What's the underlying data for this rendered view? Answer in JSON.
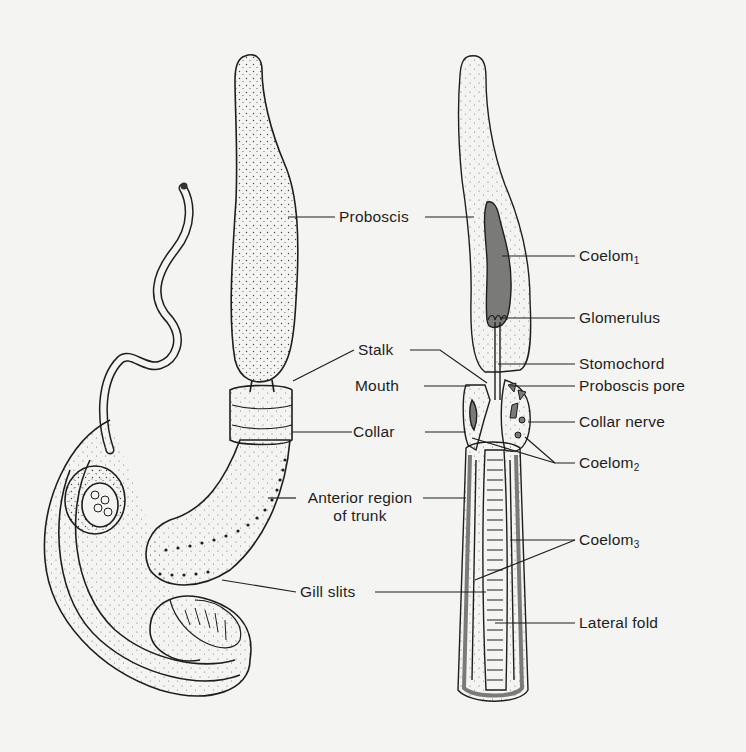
{
  "figure": {
    "background": "#f4f4f2",
    "ink": "#1e1e1e",
    "coelom_shade": "#7a7a78",
    "external_view": {
      "labels": {
        "proboscis": "Proboscis",
        "stalk": "Stalk",
        "mouth": "Mouth",
        "collar": "Collar",
        "anterior_trunk_line1": "Anterior region",
        "anterior_trunk_line2": "of trunk",
        "gill_slits": "Gill slits"
      }
    },
    "section_view": {
      "labels": {
        "coelom1": "Coelom",
        "coelom1_sub": "1",
        "glomerulus": "Glomerulus",
        "stomochord": "Stomochord",
        "proboscis_pore": "Proboscis pore",
        "collar_nerve": "Collar nerve",
        "coelom2": "Coelom",
        "coelom2_sub": "2",
        "coelom3": "Coelom",
        "coelom3_sub": "3",
        "lateral_fold": "Lateral fold"
      }
    }
  }
}
